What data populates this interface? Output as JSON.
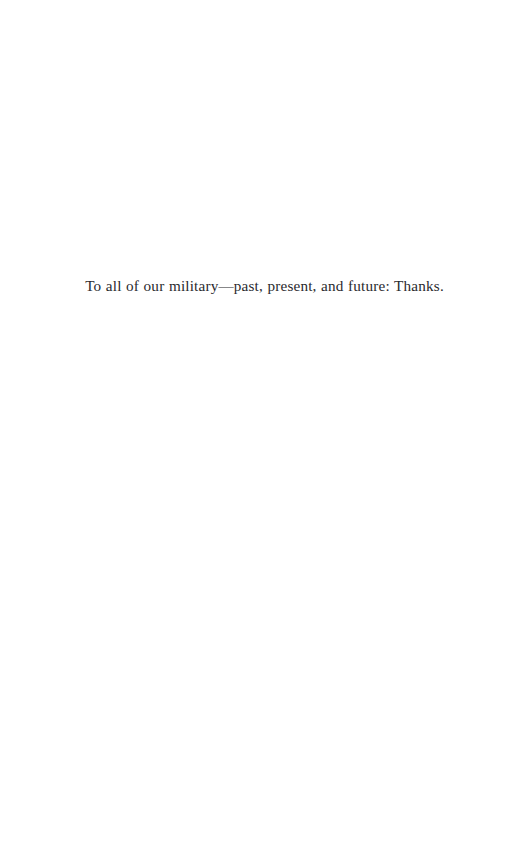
{
  "page": {
    "background_color": "#ffffff",
    "width": 529,
    "height": 861,
    "kind": "book-dedication-page"
  },
  "dedication": {
    "text": "To all of our military—past, present, and future: Thanks.",
    "color": "#2a2a2e",
    "alignment": "center"
  }
}
